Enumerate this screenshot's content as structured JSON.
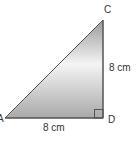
{
  "figure": {
    "type": "right-triangle",
    "vertices": [
      {
        "name": "A",
        "role": "bottom-left vertex"
      },
      {
        "name": "C",
        "role": "top vertex"
      },
      {
        "name": "D",
        "role": "right-angle vertex"
      }
    ],
    "right_angle_at": "D",
    "sides": [
      {
        "segment": "AD",
        "label": "8 cm",
        "length": 8,
        "unit": "cm"
      },
      {
        "segment": "CD",
        "label": "8 cm",
        "length": 8,
        "unit": "cm"
      }
    ],
    "labels": {
      "A": "A",
      "C": "C",
      "D": "D",
      "side_AD": "8 cm",
      "side_CD": "8 cm"
    },
    "colors": {
      "stroke": "#555555",
      "fill_dark": "#a8a8a8",
      "fill_light": "#f2f2f2",
      "text": "#333333"
    }
  }
}
